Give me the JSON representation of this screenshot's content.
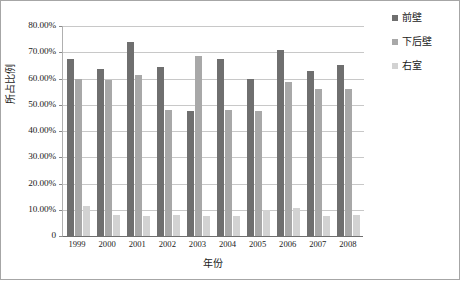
{
  "chart_data": {
    "type": "bar",
    "title": "",
    "xlabel": "年份",
    "ylabel": "所占比例",
    "categories": [
      "1999",
      "2000",
      "2001",
      "2002",
      "2003",
      "2004",
      "2005",
      "2006",
      "2007",
      "2008"
    ],
    "ylim": [
      0,
      0.8
    ],
    "ytick_labels": [
      "80.00%",
      "70.00%",
      "60.00%",
      "50.00%",
      "40.00%",
      "30.00%",
      "20.00%",
      "10.00%",
      "0"
    ],
    "ytick_values": [
      0.8,
      0.7,
      0.6,
      0.5,
      0.4,
      0.3,
      0.2,
      0.1,
      0
    ],
    "grid": true,
    "legend_position": "right",
    "series": [
      {
        "name": "前壁",
        "color": "#6f6f6f",
        "values": [
          0.675,
          0.635,
          0.74,
          0.645,
          0.475,
          0.675,
          0.6,
          0.71,
          0.63,
          0.65
        ]
      },
      {
        "name": "下后壁",
        "color": "#a8a8a8",
        "values": [
          0.6,
          0.595,
          0.615,
          0.48,
          0.685,
          0.48,
          0.475,
          0.585,
          0.56,
          0.56
        ]
      },
      {
        "name": "右室",
        "color": "#d2d2d2",
        "values": [
          0.115,
          0.08,
          0.075,
          0.08,
          0.075,
          0.075,
          0.1,
          0.105,
          0.075,
          0.08
        ]
      }
    ]
  }
}
